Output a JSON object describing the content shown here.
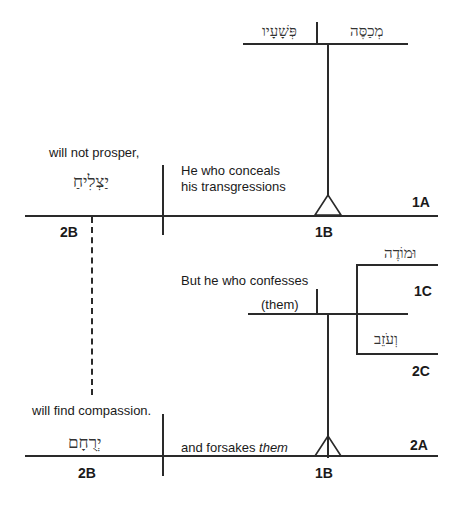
{
  "diagram": {
    "type": "sentence-diagram",
    "clause1": {
      "subject_hebrew": [
        "מְכַסֶּה",
        "פְּשָׁעָיו"
      ],
      "gloss": [
        "He who conceals",
        "his transgressions"
      ],
      "verb_hebrew": "יַצְלִיחַ",
      "verb_gloss": "will not prosper,",
      "labels": {
        "main": "1A",
        "subject": "1B",
        "predicate": "2B"
      }
    },
    "clause2": {
      "intro_gloss": "But he who confesses",
      "compound": [
        {
          "hebrew": "וּמוֹדֶה",
          "label": "1C"
        },
        {
          "hebrew": "וְעֹזֵב",
          "label": "2C"
        }
      ],
      "object": "(them)",
      "gloss": "and forsakes them",
      "gloss_plain": "and forsakes ",
      "gloss_italic": "them",
      "verb_hebrew": "יְרֻחָם",
      "verb_gloss": "will find compassion.",
      "labels": {
        "main": "2A",
        "subject": "1B",
        "predicate": "2B"
      }
    }
  }
}
